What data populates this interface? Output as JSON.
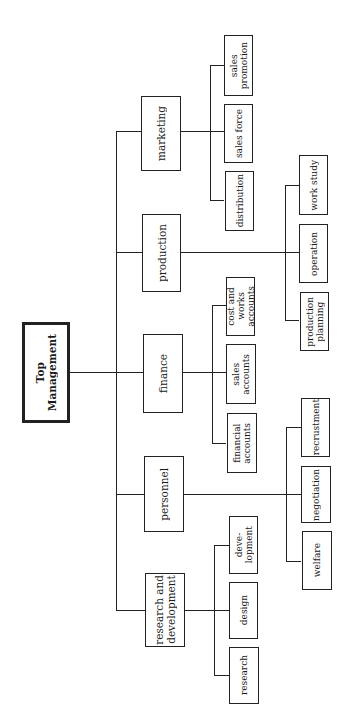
{
  "diagram": {
    "type": "organization-chart",
    "orientation": "rotated-90-ccw",
    "root": {
      "label": "Top\nManagement",
      "departments": [
        {
          "label": "marketing",
          "subunits": [
            "sales\npromotion",
            "sales force",
            "distribution"
          ]
        },
        {
          "label": "production",
          "subunits": [
            "work study",
            "operation",
            "production\nplanning"
          ]
        },
        {
          "label": "finance",
          "subunits": [
            "cost and\nworks\naccounts",
            "sales\naccounts",
            "financial\naccounts"
          ]
        },
        {
          "label": "personnel",
          "subunits": [
            "recrustment",
            "negotiation",
            "welfare"
          ]
        },
        {
          "label": "research and\ndevelopment",
          "subunits": [
            "deve-\nlopment",
            "design",
            "research"
          ]
        }
      ]
    },
    "colors": {
      "line": "#222222",
      "background": "#ffffff",
      "text": "#1a1a1a"
    }
  }
}
